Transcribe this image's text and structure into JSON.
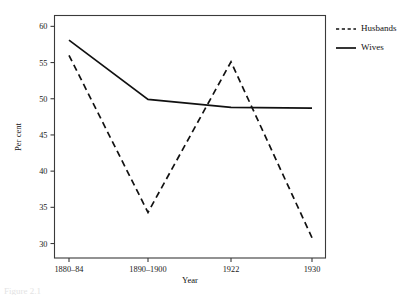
{
  "chart_data": {
    "type": "line",
    "title": "",
    "xlabel": "Year",
    "ylabel": "Per cent",
    "categories": [
      "1880–84",
      "1890–1900",
      "1922",
      "1930"
    ],
    "series": [
      {
        "name": "Husbands",
        "style": "dashed",
        "values": [
          56.0,
          34.3,
          55.1,
          30.8
        ]
      },
      {
        "name": "Wives",
        "style": "solid",
        "values": [
          58.1,
          49.9,
          48.8,
          48.7
        ]
      }
    ],
    "ylim": [
      28,
      61.5
    ],
    "yticks": [
      30,
      35,
      40,
      45,
      50,
      55,
      60
    ],
    "ytick_labels": [
      "30",
      "35",
      "40",
      "45",
      "50",
      "55",
      "60"
    ],
    "grid": false,
    "legend_position": "right",
    "frame": true
  },
  "legend": {
    "entries": [
      {
        "label": "Husbands",
        "style": "dashed"
      },
      {
        "label": "Wives",
        "style": "solid"
      }
    ]
  },
  "caption": {
    "text": "Figure 2.1"
  }
}
